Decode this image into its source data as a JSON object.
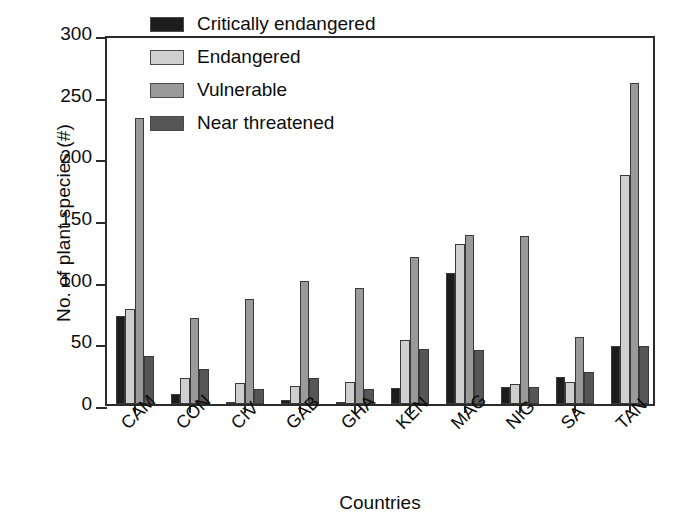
{
  "chart_data": {
    "type": "bar",
    "title": "",
    "xlabel": "Countries",
    "ylabel": "No. of plant species (#)",
    "ylim": [
      0,
      300
    ],
    "yticks": [
      0,
      50,
      100,
      150,
      200,
      250,
      300
    ],
    "grid": false,
    "legend_position": "top-center",
    "categories": [
      "CAM",
      "CON",
      "CIV",
      "GAB",
      "GHA",
      "KEN",
      "MAG",
      "NIG",
      "SA",
      "TAN"
    ],
    "series": [
      {
        "name": "Critically endangered",
        "color": "#1d1d1d",
        "values": [
          71,
          8,
          2,
          3,
          2,
          13,
          106,
          14,
          22,
          47
        ]
      },
      {
        "name": "Endangered",
        "color": "#cfcfcf",
        "values": [
          77,
          21,
          17,
          15,
          18,
          52,
          130,
          16,
          18,
          186
        ]
      },
      {
        "name": "Vulnerable",
        "color": "#9a9a9a",
        "values": [
          232,
          70,
          85,
          100,
          94,
          119,
          137,
          136,
          54,
          260
        ]
      },
      {
        "name": "Near threatened",
        "color": "#565656",
        "values": [
          39,
          28,
          12,
          21,
          12,
          45,
          44,
          14,
          26,
          47
        ]
      }
    ]
  },
  "legend": {
    "items": [
      {
        "label": "Critically endangered"
      },
      {
        "label": "Endangered"
      },
      {
        "label": "Vulnerable"
      },
      {
        "label": "Near threatened"
      }
    ]
  },
  "axes": {
    "y_title": "No. of plant species (#)",
    "x_title": "Countries",
    "y_tick_labels": [
      "300",
      "250",
      "200",
      "150",
      "100",
      "50",
      "0"
    ]
  }
}
